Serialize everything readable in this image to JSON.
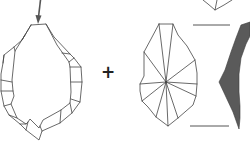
{
  "diagram": {
    "operator_symbol": "+",
    "colors": {
      "line": "#444444",
      "profile_fill": "#5a5a5a",
      "background": "#ffffff"
    },
    "elements": [
      {
        "id": "percussion-arrow",
        "label": "percussion direction arrow"
      },
      {
        "id": "core",
        "label": "core outline with peripheral flake scars"
      },
      {
        "id": "plus",
        "label": "plus sign"
      },
      {
        "id": "flake-dorsal",
        "label": "flake dorsal view with radial scars"
      },
      {
        "id": "flake-profile",
        "label": "flake profile cross-section (dark fill)"
      },
      {
        "id": "guide-lines",
        "label": "horizontal length guide lines"
      },
      {
        "id": "top-fragment",
        "label": "partial drawing cut off at top edge"
      }
    ]
  }
}
